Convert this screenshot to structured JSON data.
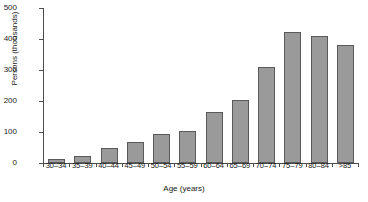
{
  "chart_data": {
    "type": "bar",
    "title": "",
    "xlabel": "Age (years)",
    "ylabel": "Persons (thousands)",
    "categories": [
      "30–34",
      "35–39",
      "40–44",
      "45–49",
      "50–54",
      "55–59",
      "60–64",
      "65–69",
      "70–74",
      "75–79",
      "80–84",
      ">85"
    ],
    "values": [
      13,
      23,
      48,
      68,
      95,
      103,
      165,
      204,
      311,
      422,
      410,
      380
    ],
    "ylim": [
      0,
      500
    ],
    "yticks": [
      0,
      100,
      200,
      300,
      400,
      500
    ],
    "ytick_labels": [
      "0",
      "100",
      "200",
      "300",
      "400",
      "500"
    ],
    "grid": false,
    "legend": null,
    "bar_color": "#9a9a9a",
    "bar_edge_color": "#5a5a5a",
    "axis_color": "#4d4d4d"
  }
}
